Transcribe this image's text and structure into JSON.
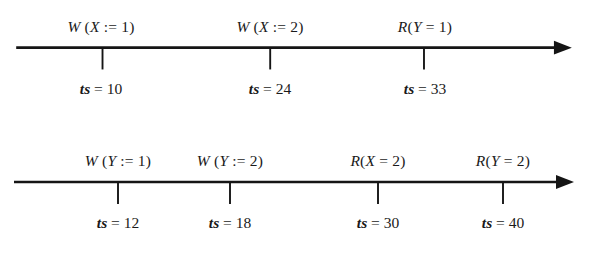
{
  "figure": {
    "background_color": "#ffffff",
    "line_color": "#151515",
    "width": 590,
    "height": 255
  },
  "timelines": [
    {
      "name": "transaction-timeline-1",
      "axis": {
        "x_start": 14,
        "x_end": 572,
        "y": 48,
        "tick_length": 22
      },
      "events": [
        {
          "x": 101,
          "operation": "W (X := 1)",
          "op_kind": "write",
          "variable": "X",
          "value": 1,
          "timestamp_label": "ts = 10",
          "timestamp": 10
        },
        {
          "x": 270,
          "operation": "W (X := 2)",
          "op_kind": "write",
          "variable": "X",
          "value": 2,
          "timestamp_label": "ts = 24",
          "timestamp": 24
        },
        {
          "x": 425,
          "operation": "R(Y = 1)",
          "op_kind": "read",
          "variable": "Y",
          "value": 1,
          "timestamp_label": "ts = 33",
          "timestamp": 33
        }
      ]
    },
    {
      "name": "transaction-timeline-2",
      "axis": {
        "x_start": 14,
        "x_end": 572,
        "y": 54,
        "tick_length": 22
      },
      "events": [
        {
          "x": 118,
          "operation": "W (Y := 1)",
          "op_kind": "write",
          "variable": "Y",
          "value": 1,
          "timestamp_label": "ts = 12",
          "timestamp": 12
        },
        {
          "x": 230,
          "operation": "W (Y := 2)",
          "op_kind": "write",
          "variable": "Y",
          "value": 2,
          "timestamp_label": "ts = 18",
          "timestamp": 18
        },
        {
          "x": 378,
          "operation": "R(X = 2)",
          "op_kind": "read",
          "variable": "X",
          "value": 2,
          "timestamp_label": "ts = 30",
          "timestamp": 30
        },
        {
          "x": 503,
          "operation": "R(Y = 2)",
          "op_kind": "read",
          "variable": "Y",
          "value": 2,
          "timestamp_label": "ts = 40",
          "timestamp": 40
        }
      ]
    }
  ]
}
